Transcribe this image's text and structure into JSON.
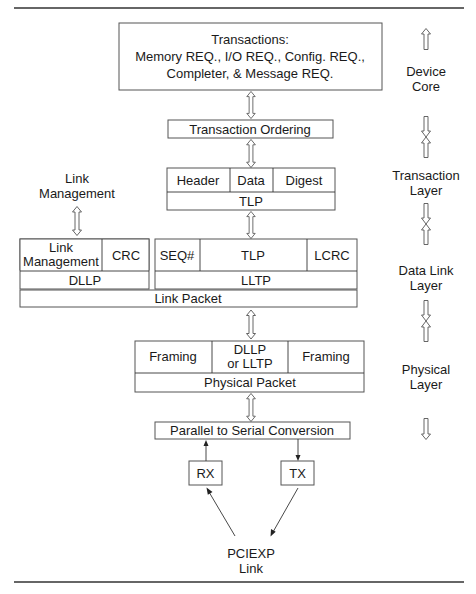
{
  "diagram": {
    "type": "pci-express-layered-architecture",
    "transactions_box": {
      "line1": "Transactions:",
      "line2": "Memory REQ., I/O REQ., Config. REQ.,",
      "line3": "Completer, &  Message REQ."
    },
    "transaction_ordering": "Transaction Ordering",
    "tlp_packet": {
      "fields": [
        "Header",
        "Data",
        "Digest"
      ],
      "label": "TLP"
    },
    "link_management_label": {
      "line1": "Link",
      "line2": "Management"
    },
    "dllp_packet": {
      "fields": [
        {
          "line1": "Link",
          "line2": "Management"
        },
        {
          "label": "CRC"
        }
      ],
      "label": "DLLP"
    },
    "lltp_packet": {
      "fields": [
        "SEQ#",
        "TLP",
        "LCRC"
      ],
      "label": "LLTP"
    },
    "link_packet": "Link Packet",
    "physical_packet": {
      "fields": [
        {
          "label": "Framing"
        },
        {
          "line1": "DLLP",
          "line2": "or LLTP"
        },
        {
          "label": "Framing"
        }
      ],
      "label": "Physical Packet"
    },
    "parallel_to_serial": "Parallel to Serial Conversion",
    "rx": "RX",
    "tx": "TX",
    "pciexp_link": {
      "line1": "PCIEXP",
      "line2": "Link"
    },
    "layers": [
      {
        "line1": "Device",
        "line2": "Core"
      },
      {
        "line1": "Transaction",
        "line2": "Layer"
      },
      {
        "line1": "Data Link",
        "line2": "Layer"
      },
      {
        "line1": "Physical",
        "line2": "Layer"
      }
    ]
  }
}
